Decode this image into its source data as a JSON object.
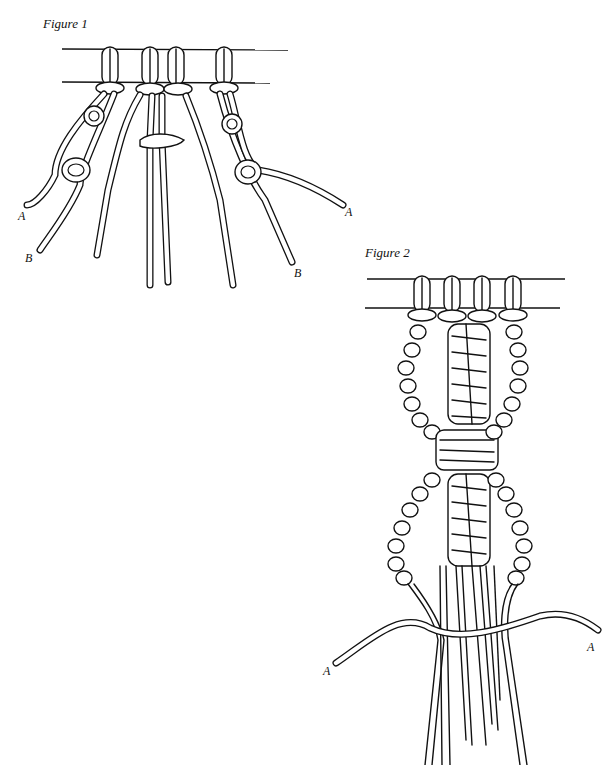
{
  "figure1": {
    "caption": "Figure 1",
    "labels": {
      "left_a": "A",
      "left_b": "B",
      "right_a": "A",
      "right_b": "B"
    }
  },
  "figure2": {
    "caption": "Figure 2",
    "labels": {
      "left_a": "A",
      "right_a": "A"
    }
  }
}
